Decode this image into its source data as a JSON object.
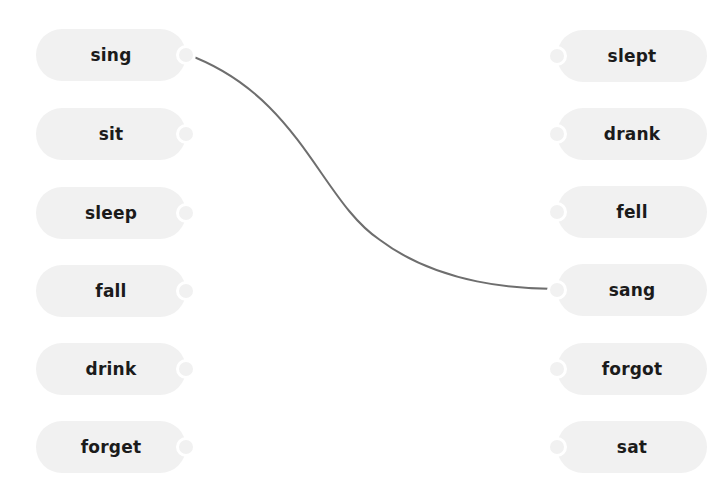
{
  "exercise": {
    "left_items": [
      {
        "label": "sing"
      },
      {
        "label": "sit"
      },
      {
        "label": "sleep"
      },
      {
        "label": "fall"
      },
      {
        "label": "drink"
      },
      {
        "label": "forget"
      }
    ],
    "right_items": [
      {
        "label": "slept"
      },
      {
        "label": "drank"
      },
      {
        "label": "fell"
      },
      {
        "label": "sang"
      },
      {
        "label": "forgot"
      },
      {
        "label": "sat"
      }
    ],
    "connections": [
      {
        "from": "sing",
        "to": "sang"
      }
    ],
    "colors": {
      "pill_background": "#f1f1f1",
      "text": "#1b1b1b",
      "connector_line": "#6e6e6e"
    }
  }
}
